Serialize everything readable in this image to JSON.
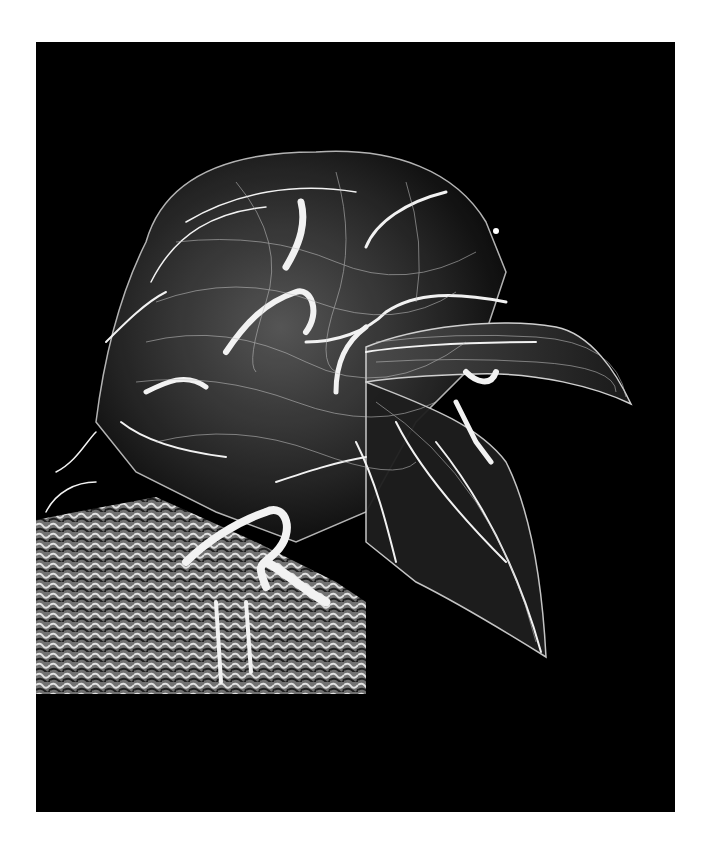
{
  "image": {
    "subject": "3D vascular rendering of a bird head (lateral view)",
    "background_color": "#000000",
    "page_color": "#ffffff",
    "vessel_color": "#e8e8e8",
    "panel": {
      "x": 36,
      "y": 42,
      "width": 639,
      "height": 770
    }
  }
}
